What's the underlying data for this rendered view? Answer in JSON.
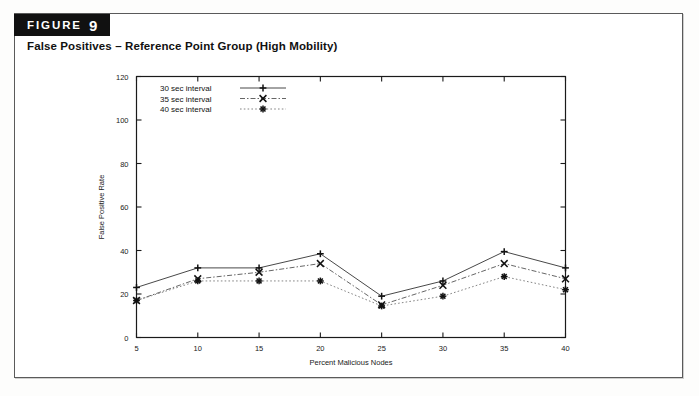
{
  "figure": {
    "badge_word": "FIGURE",
    "badge_number": "9",
    "caption": "False Positives – Reference Point Group (High Mobility)"
  },
  "chart_data": {
    "type": "line",
    "title": "",
    "xlabel": "Percent Malicious Nodes",
    "ylabel": "False Positive Rate",
    "x": [
      5,
      10,
      15,
      20,
      25,
      30,
      35,
      40
    ],
    "xlim": [
      5,
      40
    ],
    "ylim": [
      0,
      120
    ],
    "xticks": [
      "5",
      "10",
      "15",
      "20",
      "25",
      "30",
      "35",
      "40"
    ],
    "yticks": [
      "0",
      "20",
      "40",
      "60",
      "80",
      "100",
      "120"
    ],
    "grid": false,
    "legend_position": "top-center-inside",
    "series": [
      {
        "name": "30 sec interval",
        "marker": "plus",
        "linestyle": "solid",
        "color": "#333333",
        "values": [
          23,
          32,
          32,
          38.5,
          19,
          26,
          39.5,
          32
        ]
      },
      {
        "name": "35 sec interval",
        "marker": "cross",
        "linestyle": "dashdot",
        "color": "#555555",
        "values": [
          17,
          27,
          30,
          34,
          15,
          24,
          34,
          27
        ]
      },
      {
        "name": "40 sec interval",
        "marker": "star",
        "linestyle": "dotted",
        "color": "#777777",
        "values": [
          17,
          26,
          26,
          26,
          14.5,
          19,
          28,
          22
        ]
      }
    ]
  }
}
